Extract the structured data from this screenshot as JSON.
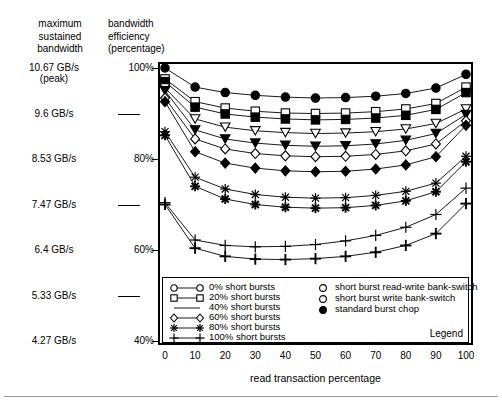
{
  "header": {
    "left_column": "maximum\nsustained\nbandwidth",
    "right_column": "bandwidth\nefficiency\n(percentage)"
  },
  "axis_left_bandwidth": [
    {
      "value": "10.67 GB/s",
      "sub": "(peak)",
      "pct": 100
    },
    {
      "value": "9.6 GB/s",
      "sub": "",
      "pct": 90
    },
    {
      "value": "8.53 GB/s",
      "sub": "",
      "pct": 80
    },
    {
      "value": "7.47 GB/s",
      "sub": "",
      "pct": 70
    },
    {
      "value": "6.4 GB/s",
      "sub": "",
      "pct": 60
    },
    {
      "value": "5.33 GB/s",
      "sub": "",
      "pct": 50
    },
    {
      "value": "4.27 GB/s",
      "sub": "",
      "pct": 40
    }
  ],
  "axis_percent_ticks": [
    "100%",
    "80%",
    "60%",
    "40%"
  ],
  "legend": {
    "title": "Legend",
    "left_entries": [
      {
        "label": "0% short bursts",
        "marker": "circle"
      },
      {
        "label": "20% short bursts",
        "marker": "square"
      },
      {
        "label": "40% short bursts",
        "marker": "triangle-down"
      },
      {
        "label": "60% short bursts",
        "marker": "diamond"
      },
      {
        "label": "80% short bursts",
        "marker": "asterisk"
      },
      {
        "label": "100% short bursts",
        "marker": "plus"
      }
    ],
    "right_entries": [
      {
        "label": "short burst read-write bank-switch",
        "marker": "open-circle"
      },
      {
        "label": "short burst write bank-switch",
        "marker": "open-circle"
      },
      {
        "label": "standard burst chop",
        "marker": "filled-circle"
      }
    ]
  },
  "chart_data": {
    "type": "line",
    "title": "",
    "xlabel": "read transaction percentage",
    "ylabel": "bandwidth efficiency (percentage)",
    "xlim": [
      0,
      100
    ],
    "ylim": [
      40,
      100
    ],
    "grid": false,
    "legend_position": "inside-bottom",
    "x": [
      0,
      10,
      20,
      30,
      40,
      50,
      60,
      70,
      80,
      90,
      100
    ],
    "xticks": [
      0,
      10,
      20,
      30,
      40,
      50,
      60,
      70,
      80,
      90,
      100
    ],
    "yticks": [
      40,
      60,
      80,
      100
    ],
    "secondary_y_label": "maximum sustained bandwidth",
    "secondary_y_ticks": [
      "4.27 GB/s",
      "5.33 GB/s",
      "6.4 GB/s",
      "7.47 GB/s",
      "8.53 GB/s",
      "9.6 GB/s",
      "10.67 GB/s (peak)"
    ],
    "series": [
      {
        "name": "0% short bursts - standard burst chop",
        "marker": "filled-circle",
        "values": [
          100.0,
          95.8,
          94.6,
          94.0,
          93.6,
          93.4,
          93.5,
          93.8,
          94.4,
          95.6,
          98.6
        ]
      },
      {
        "name": "20% short bursts - short burst read-write bank-switch",
        "marker": "open-square",
        "values": [
          97.6,
          92.6,
          91.2,
          90.5,
          90.1,
          90.0,
          90.1,
          90.4,
          91.0,
          92.2,
          95.8
        ]
      },
      {
        "name": "20% short bursts - short burst write bank-switch",
        "marker": "filled-square",
        "values": [
          97.0,
          91.4,
          89.9,
          89.2,
          88.8,
          88.6,
          88.7,
          89.0,
          89.6,
          90.9,
          94.6
        ]
      },
      {
        "name": "40% short bursts - short burst read-write bank-switch",
        "marker": "open-triangle",
        "values": [
          95.6,
          88.8,
          87.0,
          86.2,
          85.8,
          85.6,
          85.7,
          86.0,
          86.6,
          87.8,
          91.0
        ]
      },
      {
        "name": "40% short bursts - short burst write bank-switch",
        "marker": "filled-triangle",
        "values": [
          95.0,
          86.4,
          84.4,
          83.5,
          83.0,
          82.8,
          82.9,
          83.3,
          84.1,
          85.6,
          89.8
        ]
      },
      {
        "name": "60% short bursts - short burst read-write bank-switch",
        "marker": "open-diamond",
        "values": [
          93.4,
          84.4,
          82.2,
          81.2,
          80.7,
          80.5,
          80.6,
          81.0,
          81.8,
          83.3,
          88.4
        ]
      },
      {
        "name": "60% short bursts - short burst write bank-switch",
        "marker": "filled-diamond",
        "values": [
          92.6,
          81.6,
          79.1,
          78.0,
          77.4,
          77.2,
          77.3,
          77.8,
          78.7,
          80.5,
          87.4
        ]
      },
      {
        "name": "80% short bursts - short burst read-write bank-switch",
        "marker": "open-asterisk",
        "values": [
          86.0,
          76.0,
          73.4,
          72.2,
          71.6,
          71.4,
          71.5,
          72.0,
          72.9,
          74.7,
          80.6
        ]
      },
      {
        "name": "80% short bursts - short burst write bank-switch",
        "marker": "filled-asterisk",
        "values": [
          85.2,
          74.0,
          71.2,
          70.0,
          69.4,
          69.2,
          69.3,
          69.8,
          70.8,
          72.8,
          79.4
        ]
      },
      {
        "name": "100% short bursts - short burst read-write bank-switch",
        "marker": "open-plus",
        "values": [
          70.4,
          62.2,
          61.0,
          60.7,
          60.8,
          61.2,
          62.0,
          63.2,
          65.0,
          67.8,
          73.6
        ]
      },
      {
        "name": "100% short bursts - short burst write bank-switch",
        "marker": "filled-plus",
        "values": [
          70.0,
          60.4,
          58.6,
          58.0,
          57.9,
          58.1,
          58.6,
          59.5,
          61.0,
          63.6,
          70.2
        ]
      }
    ]
  }
}
